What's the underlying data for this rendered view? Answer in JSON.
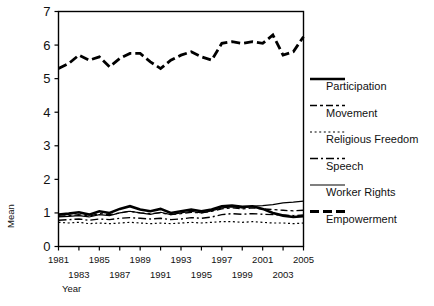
{
  "chart_data": {
    "type": "line",
    "title": "",
    "xlabel": "Year",
    "ylabel": "Mean",
    "xlim": [
      1981,
      2005
    ],
    "ylim": [
      0,
      7
    ],
    "yticks": [
      0,
      1,
      2,
      3,
      4,
      5,
      6,
      7
    ],
    "xticks": [
      1981,
      1983,
      1985,
      1987,
      1989,
      1991,
      1993,
      1995,
      1997,
      1999,
      2001,
      2003,
      2005
    ],
    "xticklabels_row1": [
      "1981",
      "1985",
      "1989",
      "1993",
      "1997",
      "2001",
      "2005"
    ],
    "xticklabels_row2": [
      "1983",
      "1987",
      "1991",
      "1995",
      "1999",
      "2003"
    ],
    "grid": false,
    "legend_position": "right",
    "x": [
      1981,
      1982,
      1983,
      1984,
      1985,
      1986,
      1987,
      1988,
      1989,
      1990,
      1991,
      1992,
      1993,
      1994,
      1995,
      1996,
      1997,
      1998,
      1999,
      2000,
      2001,
      2002,
      2003,
      2004,
      2005
    ],
    "series": [
      {
        "name": "Participation",
        "style": "solid-thick",
        "width": 2.6,
        "dash": "",
        "values": [
          0.95,
          0.98,
          1.02,
          0.95,
          1.05,
          1.0,
          1.12,
          1.2,
          1.1,
          1.05,
          1.12,
          1.0,
          1.05,
          1.1,
          1.05,
          1.1,
          1.2,
          1.22,
          1.18,
          1.2,
          1.12,
          1.0,
          0.92,
          0.88,
          0.9
        ]
      },
      {
        "name": "Movement",
        "style": "dash-dash-dot",
        "width": 1.3,
        "dash": "7,3,3,3",
        "values": [
          0.9,
          0.92,
          0.95,
          0.9,
          0.98,
          0.95,
          1.0,
          1.05,
          1.0,
          0.98,
          1.0,
          0.95,
          0.98,
          1.02,
          1.0,
          1.05,
          1.12,
          1.15,
          1.12,
          1.15,
          1.12,
          1.1,
          1.08,
          1.06,
          1.08
        ]
      },
      {
        "name": "Religious Freedom",
        "style": "dotted",
        "width": 1.2,
        "dash": "2,2.6",
        "values": [
          0.72,
          0.7,
          0.72,
          0.68,
          0.7,
          0.68,
          0.7,
          0.72,
          0.7,
          0.68,
          0.7,
          0.68,
          0.7,
          0.72,
          0.7,
          0.72,
          0.74,
          0.74,
          0.72,
          0.74,
          0.72,
          0.7,
          0.7,
          0.68,
          0.7
        ]
      },
      {
        "name": "Speech",
        "style": "dash-dot",
        "width": 1.4,
        "dash": "8,3,2,3",
        "values": [
          0.78,
          0.8,
          0.82,
          0.78,
          0.82,
          0.8,
          0.84,
          0.86,
          0.84,
          0.82,
          0.84,
          0.8,
          0.82,
          0.86,
          0.84,
          0.88,
          0.95,
          0.98,
          0.96,
          0.98,
          0.96,
          0.95,
          0.94,
          0.92,
          0.94
        ]
      },
      {
        "name": "Worker Rights",
        "style": "solid-thin",
        "width": 1.2,
        "dash": "",
        "values": [
          0.88,
          0.9,
          0.92,
          0.88,
          0.95,
          0.92,
          1.0,
          1.05,
          1.0,
          0.96,
          1.02,
          0.95,
          1.0,
          1.05,
          1.0,
          1.06,
          1.15,
          1.18,
          1.15,
          1.2,
          1.22,
          1.25,
          1.3,
          1.32,
          1.35
        ]
      },
      {
        "name": "Empowerment",
        "style": "dashed-thick",
        "width": 2.8,
        "dash": "9,4",
        "values": [
          5.3,
          5.45,
          5.7,
          5.55,
          5.65,
          5.35,
          5.6,
          5.75,
          5.75,
          5.5,
          5.3,
          5.55,
          5.7,
          5.8,
          5.65,
          5.55,
          6.05,
          6.1,
          6.05,
          6.1,
          6.05,
          6.3,
          5.7,
          5.8,
          6.25
        ]
      }
    ]
  },
  "legend": {
    "items": [
      {
        "label": "Participation"
      },
      {
        "label": "Movement"
      },
      {
        "label": "Religious Freedom"
      },
      {
        "label": "Speech"
      },
      {
        "label": "Worker Rights"
      },
      {
        "label": "Empowerment"
      }
    ]
  }
}
